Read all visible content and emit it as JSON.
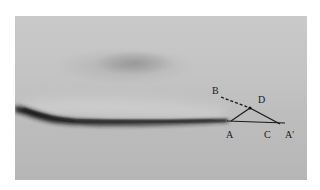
{
  "figure": {
    "background_color": "#c2c2c2",
    "streak_color": "#1e1e1e",
    "line_color": "#1a1a1a",
    "labels": {
      "A": "A",
      "B": "B",
      "C": "C",
      "D": "D",
      "A_prime": "A'"
    }
  }
}
